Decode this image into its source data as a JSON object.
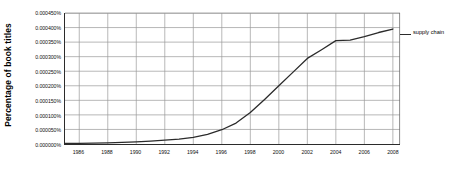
{
  "chart_data": {
    "type": "line",
    "title": "",
    "xlabel": "",
    "ylabel": "Percentage of book titles",
    "xlim": [
      1985,
      2008.5
    ],
    "ylim": [
      0.0,
      0.00045
    ],
    "grid": true,
    "legend_position": "right-outside",
    "y_tick_labels": [
      "0.000450%",
      "0.000400%",
      "0.000350%",
      "0.000300%",
      "0.000250%",
      "0.000200%",
      "0.000150%",
      "0.000100%",
      "0.000050%",
      "0.000000%"
    ],
    "y_tick_values": [
      0.00045,
      0.0004,
      0.00035,
      0.0003,
      0.00025,
      0.0002,
      0.00015,
      0.0001,
      5e-05,
      0.0
    ],
    "x_tick_labels": [
      "1986",
      "1988",
      "1990",
      "1992",
      "1994",
      "1996",
      "1998",
      "2000",
      "2002",
      "2004",
      "2006",
      "2008"
    ],
    "x_tick_values": [
      1986,
      1988,
      1990,
      1992,
      1994,
      1996,
      1998,
      2000,
      2002,
      2004,
      2006,
      2008
    ],
    "series": [
      {
        "name": "supply chain",
        "color": "#2b2b2b",
        "x": [
          1985,
          1986,
          1987,
          1988,
          1989,
          1990,
          1991,
          1992,
          1993,
          1994,
          1995,
          1996,
          1997,
          1998,
          1999,
          2000,
          2001,
          2002,
          2003,
          2004,
          2005,
          2006,
          2007,
          2008
        ],
        "values": [
          2e-06,
          2.5e-06,
          3e-06,
          4e-06,
          5.5e-06,
          7.5e-06,
          1e-05,
          1.3e-05,
          1.7e-05,
          2.3e-05,
          3.3e-05,
          4.9e-05,
          7.2e-05,
          0.000108,
          0.000153,
          0.0002,
          0.000247,
          0.000294,
          0.000324,
          0.000355,
          0.000357,
          0.000369,
          0.000383,
          0.000395
        ]
      }
    ]
  },
  "legend": {
    "entries": [
      {
        "label": "supply chain"
      }
    ]
  },
  "axis": {
    "y_title": "Percentage of book titles"
  }
}
